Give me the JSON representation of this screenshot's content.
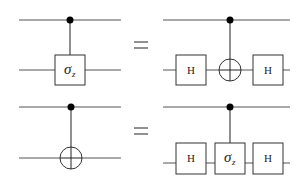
{
  "diagram": {
    "type": "quantum-circuit-identities",
    "equations": [
      {
        "lhs": {
          "gate": "controlled-sigma_z",
          "label_main": "σ",
          "label_sub": "z"
        },
        "equals": "=",
        "rhs": {
          "gates": [
            "H",
            "CNOT",
            "H"
          ],
          "h_label_1": "H",
          "h_label_2": "H"
        }
      },
      {
        "lhs": {
          "gate": "CNOT"
        },
        "equals": "=",
        "rhs": {
          "gates": [
            "H",
            "controlled-sigma_z",
            "H"
          ],
          "h_label_1": "H",
          "label_main": "σ",
          "label_sub": "z",
          "h_label_2": "H"
        }
      }
    ]
  }
}
